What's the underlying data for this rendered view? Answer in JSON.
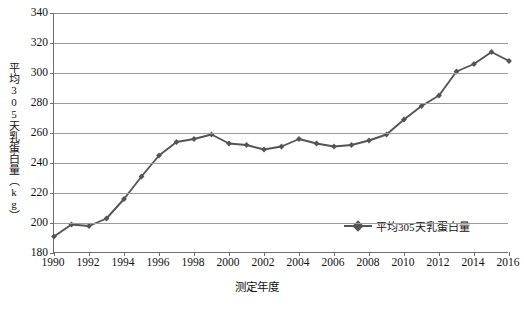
{
  "chart_data": {
    "type": "line",
    "title": "",
    "xlabel": "测定年度",
    "ylabel": "平均305天乳蛋白量（kg）",
    "ylim": [
      180,
      340
    ],
    "ytick_step": 20,
    "yticks": [
      340,
      320,
      300,
      280,
      260,
      240,
      220,
      200,
      180
    ],
    "xlim": [
      1990,
      2016
    ],
    "xticks": [
      1990,
      1992,
      1994,
      1996,
      1998,
      2000,
      2002,
      2004,
      2006,
      2008,
      2010,
      2012,
      2014,
      2016
    ],
    "grid": "horizontal",
    "legend_position": "inside-bottom-right",
    "series_color": "#545454",
    "marker": "diamond",
    "x": [
      1990,
      1991,
      1992,
      1993,
      1994,
      1995,
      1996,
      1997,
      1998,
      1999,
      2000,
      2001,
      2002,
      2003,
      2004,
      2005,
      2006,
      2007,
      2008,
      2009,
      2010,
      2011,
      2012,
      2013,
      2014,
      2015,
      2016
    ],
    "series": [
      {
        "name": "平均305天乳蛋白量",
        "values": [
          191,
          199,
          198,
          203,
          216,
          231,
          245,
          254,
          256,
          259,
          253,
          252,
          249,
          251,
          256,
          253,
          251,
          252,
          255,
          259,
          269,
          278,
          285,
          301,
          306,
          314,
          308
        ]
      }
    ]
  },
  "axis": {
    "y_title": "平均305天乳蛋白量（kg）",
    "x_title": "测定年度",
    "y_labels": [
      "340",
      "320",
      "300",
      "280",
      "260",
      "240",
      "220",
      "200",
      "180"
    ],
    "x_labels": [
      "1990",
      "1992",
      "1994",
      "1996",
      "1998",
      "2000",
      "2002",
      "2004",
      "2006",
      "2008",
      "2010",
      "2012",
      "2014",
      "2016"
    ]
  },
  "legend": {
    "label": "平均305天乳蛋白量"
  }
}
